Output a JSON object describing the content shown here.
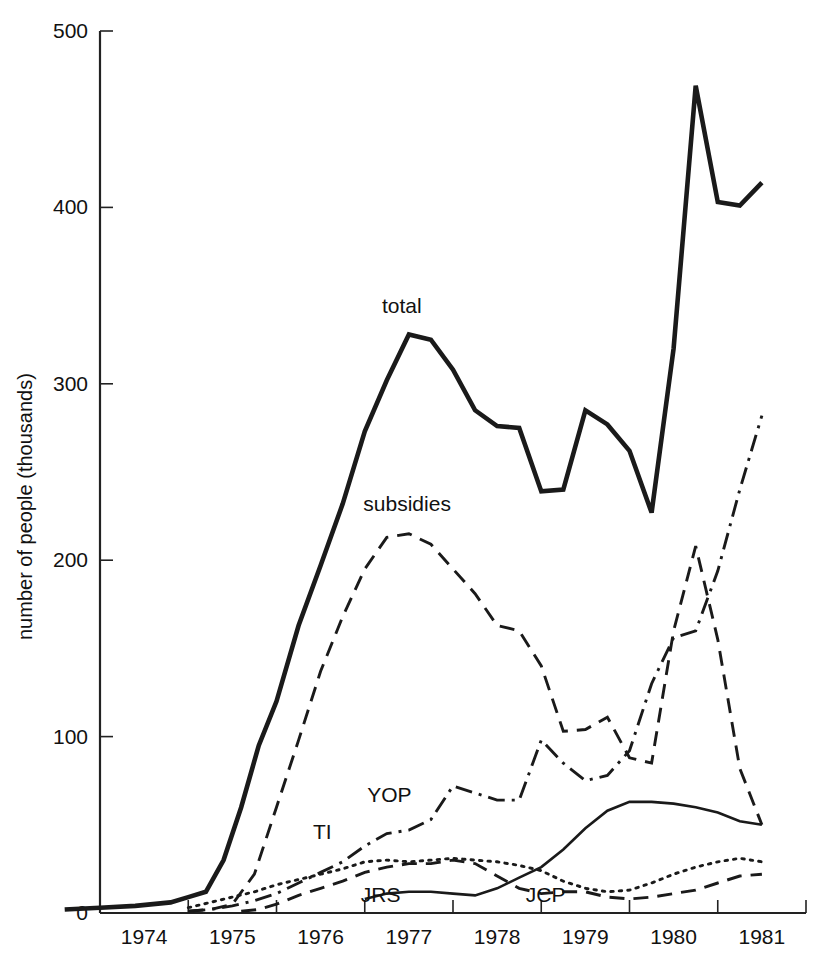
{
  "chart_data": {
    "type": "line",
    "title": "",
    "xlabel": "",
    "ylabel": "number of people (thousands)",
    "ylim": [
      0,
      500
    ],
    "xlim": [
      1973.6,
      1981.6
    ],
    "yticks": [
      0,
      100,
      200,
      300,
      400,
      500
    ],
    "ytick_labels": [
      "0",
      "100",
      "200",
      "300",
      "400",
      "500"
    ],
    "xticks": [
      1974,
      1975,
      1976,
      1977,
      1978,
      1979,
      1980,
      1981,
      1982
    ],
    "xtick_labels": [
      "1974",
      "1975",
      "1976",
      "1977",
      "1978",
      "1979",
      "1980",
      "1981"
    ],
    "grid": false,
    "legend": "inline-annotations",
    "series": [
      {
        "name": "total",
        "label": "total",
        "style": "solid-thick",
        "x": [
          1973.6,
          1974.0,
          1974.4,
          1974.8,
          1975.0,
          1975.2,
          1975.4,
          1975.6,
          1975.8,
          1976.0,
          1976.25,
          1976.5,
          1976.75,
          1977.0,
          1977.25,
          1977.5,
          1977.75,
          1978.0,
          1978.25,
          1978.5,
          1978.75,
          1979.0,
          1979.25,
          1979.5,
          1979.75,
          1980.0,
          1980.25,
          1980.5,
          1980.75,
          1981.0,
          1981.25,
          1981.5
        ],
        "y": [
          2,
          3,
          4,
          6,
          9,
          12,
          30,
          60,
          95,
          120,
          163,
          197,
          232,
          273,
          302,
          328,
          325,
          308,
          285,
          276,
          275,
          239,
          240,
          285,
          277,
          262,
          227,
          320,
          469,
          403,
          401,
          414
        ]
      },
      {
        "name": "subsidies",
        "label": "subsidies",
        "style": "dashed",
        "x": [
          1975.0,
          1975.25,
          1975.5,
          1975.75,
          1976.0,
          1976.25,
          1976.5,
          1976.75,
          1977.0,
          1977.25,
          1977.5,
          1977.75,
          1978.0,
          1978.25,
          1978.5,
          1978.75,
          1979.0,
          1979.25,
          1979.5,
          1979.75,
          1980.0,
          1980.25,
          1980.5,
          1980.75,
          1981.0,
          1981.25,
          1981.5
        ],
        "y": [
          1,
          2,
          5,
          22,
          60,
          98,
          137,
          168,
          195,
          213,
          215,
          209,
          195,
          181,
          163,
          160,
          140,
          103,
          104,
          111,
          88,
          85,
          160,
          208,
          155,
          82,
          50
        ]
      },
      {
        "name": "YOP",
        "label": "YOP",
        "style": "dash-dot",
        "x": [
          1975.0,
          1975.25,
          1975.5,
          1975.75,
          1976.0,
          1976.25,
          1976.5,
          1976.75,
          1977.0,
          1977.25,
          1977.5,
          1977.75,
          1978.0,
          1978.25,
          1978.5,
          1978.75,
          1979.0,
          1979.25,
          1979.5,
          1979.75,
          1980.0,
          1980.25,
          1980.5,
          1980.75,
          1981.0,
          1981.25,
          1981.5
        ],
        "y": [
          1,
          2,
          4,
          7,
          11,
          17,
          23,
          29,
          38,
          45,
          47,
          53,
          72,
          68,
          64,
          64,
          98,
          85,
          75,
          78,
          92,
          130,
          156,
          160,
          194,
          240,
          282
        ]
      },
      {
        "name": "TI",
        "label": "TI",
        "style": "dotted",
        "x": [
          1975.0,
          1975.25,
          1975.5,
          1975.75,
          1976.0,
          1976.25,
          1976.5,
          1976.75,
          1977.0,
          1977.25,
          1977.5,
          1977.75,
          1978.0,
          1978.25,
          1978.5,
          1978.75,
          1979.0,
          1979.25,
          1979.5,
          1979.75,
          1980.0,
          1980.25,
          1980.5,
          1980.75,
          1981.0,
          1981.25,
          1981.5
        ],
        "y": [
          3,
          6,
          9,
          12,
          16,
          19,
          22,
          25,
          29,
          30,
          29,
          30,
          31,
          30,
          29,
          27,
          24,
          18,
          14,
          12,
          13,
          17,
          22,
          26,
          29,
          31,
          29
        ]
      },
      {
        "name": "JRS",
        "label": "JRS",
        "style": "solid-thin",
        "x": [
          1977.0,
          1977.25,
          1977.5,
          1977.75,
          1978.0,
          1978.25,
          1978.5,
          1978.75,
          1979.0,
          1979.25,
          1979.5,
          1979.75,
          1980.0,
          1980.25,
          1980.5,
          1980.75,
          1981.0,
          1981.25,
          1981.5
        ],
        "y": [
          8,
          11,
          12,
          12,
          11,
          10,
          14,
          20,
          26,
          36,
          48,
          58,
          63,
          63,
          62,
          60,
          57,
          52,
          50
        ]
      },
      {
        "name": "JCP",
        "label": "JCP",
        "style": "dashed",
        "x": [
          1975.6,
          1975.8,
          1976.0,
          1976.25,
          1976.5,
          1976.75,
          1977.0,
          1977.25,
          1977.5,
          1977.75,
          1978.0,
          1978.25,
          1978.5,
          1978.75,
          1979.0,
          1979.25,
          1979.5,
          1979.75,
          1980.0,
          1980.25,
          1980.5,
          1980.75,
          1981.0,
          1981.25,
          1981.5
        ],
        "y": [
          1,
          2,
          5,
          10,
          14,
          18,
          23,
          26,
          28,
          28,
          30,
          28,
          21,
          14,
          11,
          12,
          12,
          9,
          8,
          9,
          11,
          13,
          17,
          21,
          22
        ]
      }
    ],
    "annotations": [
      {
        "text": "total",
        "x": 1977.42,
        "y": 340,
        "name": "annotation-total"
      },
      {
        "text": "subsidies",
        "x": 1977.48,
        "y": 228,
        "name": "annotation-subsidies"
      },
      {
        "text": "YOP",
        "x": 1977.28,
        "y": 63,
        "name": "annotation-yop"
      },
      {
        "text": "TI",
        "x": 1976.52,
        "y": 42,
        "name": "annotation-ti"
      },
      {
        "text": "JRS",
        "x": 1977.18,
        "y": 6,
        "name": "annotation-jrs"
      },
      {
        "text": "JCP",
        "x": 1979.05,
        "y": 6,
        "name": "annotation-jcp"
      }
    ],
    "colors": {
      "ink": "#1a1a1a",
      "background": "#ffffff"
    }
  }
}
